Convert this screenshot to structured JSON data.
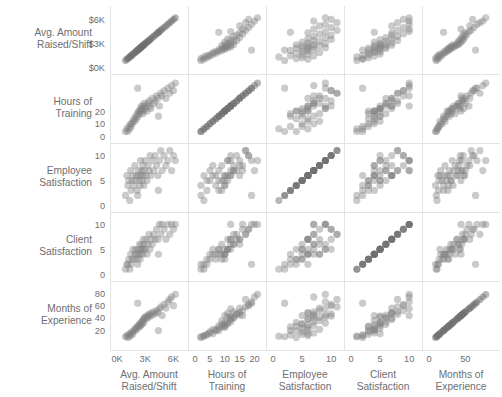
{
  "chart_data": {
    "type": "scatter",
    "title": "",
    "subtitle": "",
    "layout": "scatter-plot-matrix",
    "grid": true,
    "legend": null,
    "n_points": 50,
    "variables": [
      {
        "key": "raised",
        "label_line1": "Avg. Amount",
        "label_line2": "Raised/Shift",
        "axis_label": "Avg. Amount Raised/Shift",
        "ticks": [
          "0K",
          "3K",
          "6K"
        ],
        "row_ticks": [
          "$0K",
          "$3K",
          "$6K"
        ],
        "tick_values": [
          0,
          3000,
          6000
        ],
        "lim": [
          0,
          6800
        ]
      },
      {
        "key": "training",
        "label_line1": "Hours of",
        "label_line2": "Training",
        "axis_label": "Hours of Training",
        "ticks": [
          "0",
          "5",
          "10",
          "15",
          "20"
        ],
        "row_ticks": [
          "0",
          "10",
          "20"
        ],
        "tick_values": [
          0,
          5,
          10,
          15,
          20
        ],
        "lim": [
          0,
          21.5
        ]
      },
      {
        "key": "employee",
        "label_line1": "Employee",
        "label_line2": "Satisfaction",
        "axis_label": "Employee Satisfaction",
        "ticks": [
          "0",
          "5",
          "10"
        ],
        "row_ticks": [
          "0",
          "5",
          "10"
        ],
        "tick_values": [
          0,
          5,
          10
        ],
        "lim": [
          0,
          11
        ]
      },
      {
        "key": "client",
        "label_line1": "Client",
        "label_line2": "Satisfaction",
        "axis_label": "Client Satisfaction",
        "ticks": [
          "0",
          "5",
          "10"
        ],
        "row_ticks": [
          "0",
          "5",
          "10"
        ],
        "tick_values": [
          0,
          5,
          10
        ],
        "lim": [
          0,
          11
        ]
      },
      {
        "key": "experience",
        "label_line1": "Months of",
        "label_line2": "Experience",
        "axis_label": "Months of Experience",
        "ticks": [
          "0",
          "50"
        ],
        "row_ticks": [
          "20",
          "40",
          "60",
          "80"
        ],
        "tick_values": [
          0,
          50
        ],
        "lim": [
          0,
          88
        ]
      }
    ],
    "colors": {
      "point": "#808082",
      "point_opacity": 0.42,
      "gridline": "#e3e3e5",
      "text": "#6d6e71",
      "background": "#ffffff"
    },
    "points": [
      {
        "raised": 900,
        "training": 2,
        "employee": 2,
        "client": 1,
        "experience": 10
      },
      {
        "raised": 1050,
        "training": 3,
        "employee": 6,
        "client": 2,
        "experience": 12
      },
      {
        "raised": 1150,
        "training": 2,
        "employee": 4,
        "client": 2,
        "experience": 9
      },
      {
        "raised": 1250,
        "training": 4,
        "employee": 5,
        "client": 3,
        "experience": 14
      },
      {
        "raised": 1350,
        "training": 3,
        "employee": 1,
        "client": 1,
        "experience": 11
      },
      {
        "raised": 1450,
        "training": 5,
        "employee": 7,
        "client": 4,
        "experience": 16
      },
      {
        "raised": 1500,
        "training": 4,
        "employee": 3,
        "client": 2,
        "experience": 13
      },
      {
        "raised": 1600,
        "training": 5,
        "employee": 5,
        "client": 3,
        "experience": 18
      },
      {
        "raised": 1700,
        "training": 6,
        "employee": 6,
        "client": 5,
        "experience": 15
      },
      {
        "raised": 1800,
        "training": 7,
        "employee": 4,
        "client": 3,
        "experience": 20
      },
      {
        "raised": 1900,
        "training": 6,
        "employee": 8,
        "client": 4,
        "experience": 22
      },
      {
        "raised": 2000,
        "training": 8,
        "employee": 5,
        "client": 5,
        "experience": 24
      },
      {
        "raised": 2050,
        "training": 7,
        "employee": 6,
        "client": 4,
        "experience": 21
      },
      {
        "raised": 2150,
        "training": 9,
        "employee": 3,
        "client": 3,
        "experience": 26
      },
      {
        "raised": 2250,
        "training": 8,
        "employee": 7,
        "client": 5,
        "experience": 28
      },
      {
        "raised": 2300,
        "training": 10,
        "employee": 6,
        "client": 4,
        "experience": 25
      },
      {
        "raised": 2400,
        "training": 9,
        "employee": 5,
        "client": 6,
        "experience": 30
      },
      {
        "raised": 2450,
        "training": 10,
        "employee": 4,
        "client": 3,
        "experience": 27
      },
      {
        "raised": 2500,
        "training": 11,
        "employee": 9,
        "client": 5,
        "experience": 32
      },
      {
        "raised": 2550,
        "training": 10,
        "employee": 6,
        "client": 4,
        "experience": 29
      },
      {
        "raised": 2600,
        "training": 12,
        "employee": 7,
        "client": 6,
        "experience": 34
      },
      {
        "raised": 2700,
        "training": 11,
        "employee": 5,
        "client": 5,
        "experience": 31
      },
      {
        "raised": 2750,
        "training": 9,
        "employee": 8,
        "client": 4,
        "experience": 36
      },
      {
        "raised": 2800,
        "training": 12,
        "employee": 6,
        "client": 7,
        "experience": 38
      },
      {
        "raised": 2850,
        "training": 10,
        "employee": 4,
        "client": 5,
        "experience": 33
      },
      {
        "raised": 2900,
        "training": 13,
        "employee": 7,
        "client": 6,
        "experience": 40
      },
      {
        "raised": 3000,
        "training": 11,
        "employee": 9,
        "client": 5,
        "experience": 42
      },
      {
        "raised": 3100,
        "training": 12,
        "employee": 6,
        "client": 7,
        "experience": 39
      },
      {
        "raised": 3200,
        "training": 10,
        "employee": 5,
        "client": 4,
        "experience": 44
      },
      {
        "raised": 3300,
        "training": 13,
        "employee": 8,
        "client": 6,
        "experience": 41
      },
      {
        "raised": 3400,
        "training": 14,
        "employee": 7,
        "client": 8,
        "experience": 46
      },
      {
        "raised": 3500,
        "training": 12,
        "employee": 10,
        "client": 5,
        "experience": 43
      },
      {
        "raised": 3600,
        "training": 11,
        "employee": 6,
        "client": 7,
        "experience": 48
      },
      {
        "raised": 3750,
        "training": 15,
        "employee": 9,
        "client": 6,
        "experience": 45
      },
      {
        "raised": 3900,
        "training": 13,
        "employee": 7,
        "client": 8,
        "experience": 50
      },
      {
        "raised": 4050,
        "training": 14,
        "employee": 10,
        "client": 7,
        "experience": 47
      },
      {
        "raised": 4200,
        "training": 16,
        "employee": 8,
        "client": 9,
        "experience": 52
      },
      {
        "raised": 4350,
        "training": 15,
        "employee": 6,
        "client": 7,
        "experience": 49
      },
      {
        "raised": 4500,
        "training": 12,
        "employee": 9,
        "client": 10,
        "experience": 55
      },
      {
        "raised": 4650,
        "training": 17,
        "employee": 11,
        "client": 8,
        "experience": 58
      },
      {
        "raised": 4800,
        "training": 16,
        "employee": 7,
        "client": 10,
        "experience": 44
      },
      {
        "raised": 5000,
        "training": 18,
        "employee": 10,
        "client": 9,
        "experience": 62
      },
      {
        "raised": 5200,
        "training": 15,
        "employee": 8,
        "client": 7,
        "experience": 56
      },
      {
        "raised": 5400,
        "training": 19,
        "employee": 9,
        "client": 10,
        "experience": 66
      },
      {
        "raised": 5600,
        "training": 17,
        "employee": 11,
        "client": 8,
        "experience": 70
      },
      {
        "raised": 5800,
        "training": 20,
        "employee": 7,
        "client": 10,
        "experience": 74
      },
      {
        "raised": 6000,
        "training": 18,
        "employee": 10,
        "client": 9,
        "experience": 60
      },
      {
        "raised": 6200,
        "training": 21,
        "employee": 9,
        "client": 10,
        "experience": 78
      },
      {
        "raised": 2200,
        "training": 19,
        "employee": 2,
        "client": 2,
        "experience": 64
      },
      {
        "raised": 4400,
        "training": 8,
        "employee": 3,
        "client": 4,
        "experience": 20
      }
    ]
  }
}
